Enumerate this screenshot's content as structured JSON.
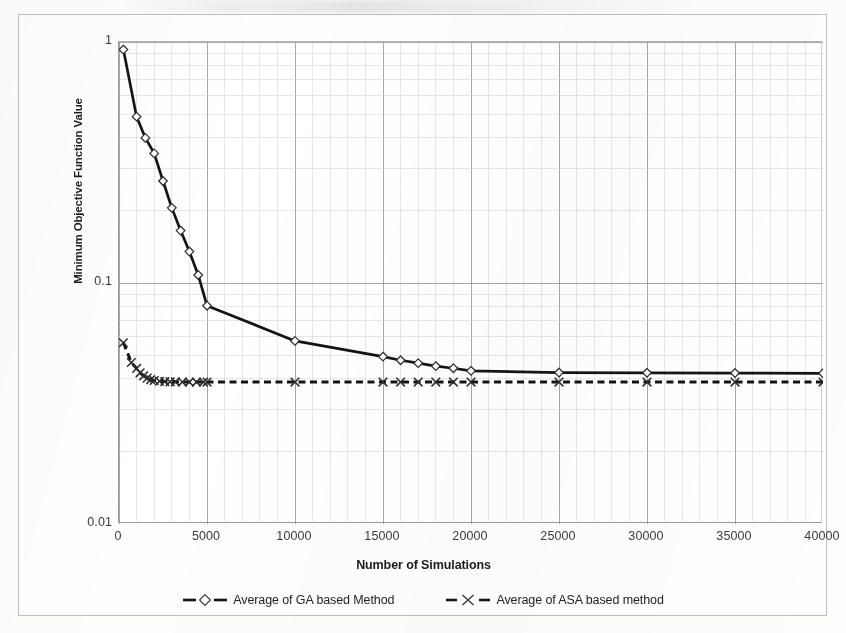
{
  "chart_data": {
    "type": "line",
    "title": "",
    "xlabel": "Number of Simulations",
    "ylabel": "Minimum Objective Function Value",
    "yscale": "log",
    "xlim": [
      0,
      40000
    ],
    "ylim": [
      0.01,
      1
    ],
    "grid": true,
    "legend_position": "bottom",
    "x_ticks": [
      0,
      5000,
      10000,
      15000,
      20000,
      25000,
      30000,
      35000,
      40000
    ],
    "x_tick_labels": [
      "0",
      "5000",
      "10000",
      "15000",
      "20000",
      "25000",
      "30000",
      "35000",
      "40000"
    ],
    "y_ticks": [
      0.01,
      0.1,
      1
    ],
    "y_tick_labels": [
      "0.01",
      "0.1",
      "1"
    ],
    "series": [
      {
        "name": "Average of GA based Method",
        "marker": "diamond-open",
        "line": "solid-thick",
        "color": "#141414",
        "x": [
          250,
          1000,
          1500,
          2000,
          2500,
          3000,
          3500,
          4000,
          4500,
          5000,
          10000,
          15000,
          16000,
          17000,
          18000,
          19000,
          20000,
          25000,
          30000,
          35000,
          40000
        ],
        "y": [
          0.93,
          0.49,
          0.4,
          0.345,
          0.265,
          0.205,
          0.165,
          0.135,
          0.108,
          0.0805,
          0.0575,
          0.0495,
          0.0478,
          0.0465,
          0.0452,
          0.0443,
          0.0432,
          0.0425,
          0.0424,
          0.0423,
          0.0422
        ]
      },
      {
        "name": "Average of ASA based method",
        "marker": "x-cross",
        "line": "dashed",
        "color": "#141414",
        "x": [
          250,
          700,
          1000,
          1200,
          1400,
          1600,
          1800,
          2000,
          2300,
          2600,
          2900,
          3200,
          3600,
          4000,
          4400,
          4800,
          5000,
          10000,
          15000,
          16000,
          17000,
          18000,
          19000,
          20000,
          25000,
          30000,
          35000,
          40000
        ],
        "y": [
          0.0565,
          0.0468,
          0.0442,
          0.0424,
          0.0412,
          0.0403,
          0.0397,
          0.0394,
          0.0391,
          0.039,
          0.0389,
          0.0389,
          0.0388,
          0.0388,
          0.0388,
          0.0388,
          0.0388,
          0.0388,
          0.0388,
          0.0388,
          0.0388,
          0.0388,
          0.0388,
          0.0388,
          0.0388,
          0.0388,
          0.0388,
          0.0388
        ]
      }
    ]
  },
  "legend": {
    "items": [
      {
        "label": "Average of GA based Method",
        "marker": "diamond-open"
      },
      {
        "label": "Average of ASA based method",
        "marker": "x-cross"
      }
    ]
  },
  "axes": {
    "x_title": "Number of Simulations",
    "y_title": "Minimum Objective Function Value"
  },
  "colors": {
    "series_line": "#141414",
    "grid_major": "#9d9d9d",
    "grid_minor": "#d7d7d7",
    "axis": "#8f8f8f",
    "text": "#2b2b2b",
    "plot_background": "#ffffff",
    "page_background": "#fdfdfc"
  }
}
